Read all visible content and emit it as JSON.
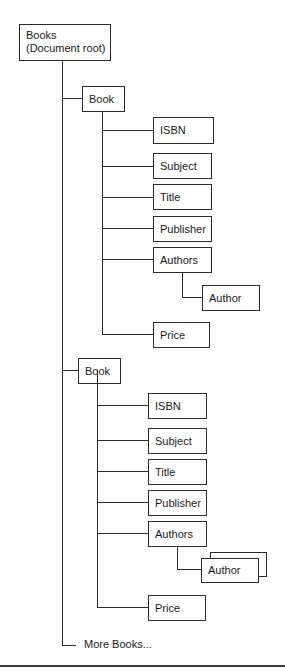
{
  "diagram": {
    "type": "tree",
    "root": {
      "line1": "Books",
      "line2": "(Document root)"
    },
    "books": [
      {
        "label": "Book",
        "children": {
          "isbn": "ISBN",
          "subject": "Subject",
          "title": "Title",
          "publisher": "Publisher",
          "authors": "Authors",
          "author": "Author",
          "price": "Price"
        },
        "author_multiple": false
      },
      {
        "label": "Book",
        "children": {
          "isbn": "ISBN",
          "subject": "Subject",
          "title": "Title",
          "publisher": "Publisher",
          "authors": "Authors",
          "author": "Author",
          "price": "Price"
        },
        "author_multiple": true
      }
    ],
    "more": "More Books...",
    "colors": {
      "line": "#2a2a2a",
      "box_fill": "#ffffff",
      "text": "#1a1a1a"
    }
  }
}
